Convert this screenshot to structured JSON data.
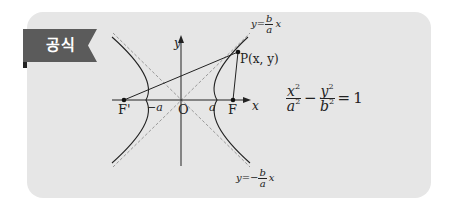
{
  "badge": {
    "label": "공식",
    "color": "#5b5b5b"
  },
  "card": {
    "background": "#e6e6e6"
  },
  "diagram": {
    "axes": {
      "x_label": "x",
      "y_label": "y",
      "origin_label": "O"
    },
    "vertices": {
      "left": "−a",
      "right": "a"
    },
    "foci": {
      "left": "F'",
      "right": "F"
    },
    "point": {
      "label": "P(x, y)",
      "name": "P",
      "coords": "x, y"
    },
    "asymptote_upper": {
      "lhs": "y=",
      "num": "b",
      "den": "a",
      "var": "x",
      "sign": ""
    },
    "asymptote_lower": {
      "lhs": "y=−",
      "num": "b",
      "den": "a",
      "var": "x",
      "sign": "−"
    }
  },
  "formula": {
    "term1": {
      "num": "x",
      "num_exp": "2",
      "den": "a",
      "den_exp": "2"
    },
    "operator": "−",
    "term2": {
      "num": "y",
      "num_exp": "2",
      "den": "b",
      "den_exp": "2"
    },
    "equals": "=",
    "rhs": "1"
  }
}
